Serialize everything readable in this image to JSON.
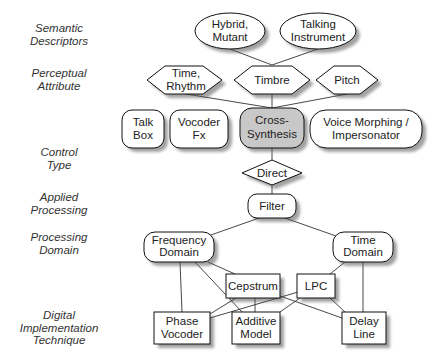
{
  "row_labels": [
    {
      "id": "semantic",
      "lines": [
        "Semantic",
        "Descriptors"
      ],
      "y": 28
    },
    {
      "id": "perceptual",
      "lines": [
        "Perceptual",
        "Attribute"
      ],
      "y": 73
    },
    {
      "id": "control",
      "lines": [
        "Control",
        "Type"
      ],
      "y": 147
    },
    {
      "id": "applied",
      "lines": [
        "Applied",
        "Processing"
      ],
      "y": 192
    },
    {
      "id": "domain",
      "lines": [
        "Processing",
        "Domain"
      ],
      "y": 232
    },
    {
      "id": "digital",
      "lines": [
        "Digital",
        "Implementation",
        "Technique"
      ],
      "y": 309
    }
  ],
  "nodes": {
    "hybrid": {
      "line1": "Hybrid,",
      "line2": "Mutant",
      "shape": "ellipse"
    },
    "talking": {
      "line1": "Talking",
      "line2": "Instrument",
      "shape": "ellipse"
    },
    "time_rhythm": {
      "line1": "Time,",
      "line2": "Rhythm",
      "shape": "hexagon"
    },
    "timbre": {
      "line1": "Timbre",
      "shape": "hexagon"
    },
    "pitch": {
      "line1": "Pitch",
      "shape": "hexagon"
    },
    "talk_box": {
      "line1": "Talk",
      "line2": "Box",
      "shape": "rounded"
    },
    "vocoder_fx": {
      "line1": "Vocoder",
      "line2": "Fx",
      "shape": "rounded"
    },
    "cross_synthesis": {
      "line1": "Cross-",
      "line2": "Synthesis",
      "shape": "rounded",
      "highlighted": true,
      "fill": "#c8c8c8"
    },
    "voice_morphing": {
      "line1": "Voice Morphing /",
      "line2": "Impersonator",
      "shape": "rounded"
    },
    "direct": {
      "line1": "Direct",
      "shape": "diamond"
    },
    "filter": {
      "line1": "Filter",
      "shape": "rounded"
    },
    "frequency_domain": {
      "line1": "Frequency",
      "line2": "Domain",
      "shape": "rounded"
    },
    "time_domain": {
      "line1": "Time",
      "line2": "Domain",
      "shape": "rounded"
    },
    "cepstrum": {
      "line1": "Cepstrum",
      "shape": "rect"
    },
    "lpc": {
      "line1": "LPC",
      "shape": "rect"
    },
    "phase_vocoder": {
      "line1": "Phase",
      "line2": "Vocoder",
      "shape": "rect"
    },
    "additive_model": {
      "line1": "Additive",
      "line2": "Model",
      "shape": "rect"
    },
    "delay_line": {
      "line1": "Delay",
      "line2": "Line",
      "shape": "rect"
    }
  },
  "edges": [
    [
      "hybrid",
      "timbre"
    ],
    [
      "talking",
      "timbre"
    ],
    [
      "time_rhythm",
      "cross_synthesis"
    ],
    [
      "timbre",
      "cross_synthesis"
    ],
    [
      "pitch",
      "cross_synthesis"
    ],
    [
      "cross_synthesis",
      "direct"
    ],
    [
      "direct",
      "filter"
    ],
    [
      "filter",
      "frequency_domain"
    ],
    [
      "filter",
      "time_domain"
    ],
    [
      "frequency_domain",
      "phase_vocoder"
    ],
    [
      "frequency_domain",
      "additive_model"
    ],
    [
      "frequency_domain",
      "cepstrum"
    ],
    [
      "time_domain",
      "lpc"
    ],
    [
      "time_domain",
      "delay_line"
    ],
    [
      "cepstrum",
      "phase_vocoder"
    ],
    [
      "cepstrum",
      "additive_model"
    ],
    [
      "cepstrum",
      "delay_line"
    ],
    [
      "lpc",
      "phase_vocoder"
    ],
    [
      "lpc",
      "additive_model"
    ],
    [
      "lpc",
      "delay_line"
    ]
  ],
  "colors": {
    "stroke": "#111111",
    "fill": "#ffffff",
    "highlight": "#c8c8c8",
    "label_text": "#333333"
  }
}
